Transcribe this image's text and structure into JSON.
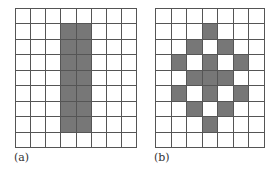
{
  "figure": {
    "panels": [
      {
        "label": "(a)",
        "cols": 8,
        "rows": 9,
        "filled": [
          [
            1,
            3
          ],
          [
            1,
            4
          ],
          [
            2,
            3
          ],
          [
            2,
            4
          ],
          [
            3,
            3
          ],
          [
            3,
            4
          ],
          [
            4,
            3
          ],
          [
            4,
            4
          ],
          [
            5,
            3
          ],
          [
            5,
            4
          ],
          [
            6,
            3
          ],
          [
            6,
            4
          ],
          [
            7,
            3
          ],
          [
            7,
            4
          ]
        ]
      },
      {
        "label": "(b)",
        "cols": 7,
        "rows": 9,
        "filled": [
          [
            1,
            3
          ],
          [
            2,
            2
          ],
          [
            2,
            4
          ],
          [
            3,
            1
          ],
          [
            3,
            3
          ],
          [
            3,
            5
          ],
          [
            4,
            2
          ],
          [
            4,
            3
          ],
          [
            4,
            4
          ],
          [
            5,
            1
          ],
          [
            5,
            3
          ],
          [
            5,
            5
          ],
          [
            6,
            2
          ],
          [
            6,
            4
          ],
          [
            7,
            3
          ]
        ]
      }
    ],
    "colors": {
      "fill": "#777777",
      "grid_line": "#555555",
      "background": "#ffffff"
    }
  }
}
